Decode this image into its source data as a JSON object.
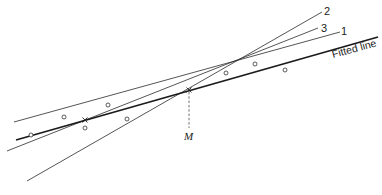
{
  "diagram": {
    "labels": {
      "line_1": "1",
      "line_2": "2",
      "line_3": "3",
      "fitted_line": "Fitted line",
      "mean_point": "M"
    },
    "fitted_line": {
      "x1": 16,
      "y1": 140,
      "x2": 378,
      "y2": 37
    },
    "lines": [
      {
        "id": "1",
        "x1": 14,
        "y1": 122,
        "x2": 340,
        "y2": 32
      },
      {
        "id": "2",
        "x1": 27,
        "y1": 181,
        "x2": 322,
        "y2": 12
      },
      {
        "id": "3",
        "x1": 7,
        "y1": 151,
        "x2": 318,
        "y2": 28
      }
    ],
    "cross_marks": [
      {
        "x": 85,
        "y": 120
      },
      {
        "x": 189,
        "y": 90
      }
    ],
    "data_points": [
      {
        "x": 31,
        "y": 135
      },
      {
        "x": 64,
        "y": 117
      },
      {
        "x": 85,
        "y": 128
      },
      {
        "x": 108,
        "y": 105
      },
      {
        "x": 127,
        "y": 119
      },
      {
        "x": 226,
        "y": 73
      },
      {
        "x": 255,
        "y": 64
      },
      {
        "x": 285,
        "y": 70
      }
    ]
  }
}
